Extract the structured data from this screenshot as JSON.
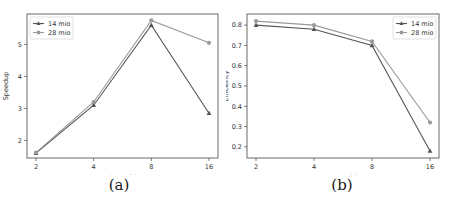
{
  "chart_data": [
    {
      "type": "line",
      "title": "",
      "caption": "(a)",
      "xlabel": "Number of GPUs",
      "ylabel": "Speedup",
      "x": [
        2,
        4,
        8,
        16
      ],
      "x_tick_labels": [
        "2",
        "4",
        "8",
        "16"
      ],
      "x_scale": "log2",
      "y_ticks": [
        2,
        3,
        4,
        5
      ],
      "ylim": [
        1.45,
        5.95
      ],
      "grid": false,
      "legend_position": "upper left",
      "series": [
        {
          "name": "14 mio",
          "marker": "triangle",
          "color": "#555555",
          "values": [
            1.6,
            3.1,
            5.6,
            2.85
          ]
        },
        {
          "name": "28 mio",
          "marker": "circle",
          "color": "#999999",
          "values": [
            1.62,
            3.2,
            5.75,
            5.05
          ]
        }
      ]
    },
    {
      "type": "line",
      "title": "",
      "caption": "(b)",
      "xlabel": "Number of GPUs",
      "ylabel": "Efficiency",
      "x": [
        2,
        4,
        8,
        16
      ],
      "x_tick_labels": [
        "2",
        "4",
        "8",
        "16"
      ],
      "x_scale": "log2",
      "y_ticks": [
        0.2,
        0.3,
        0.4,
        0.5,
        0.6,
        0.7,
        0.8
      ],
      "ylim": [
        0.145,
        0.855
      ],
      "grid": false,
      "legend_position": "upper right",
      "series": [
        {
          "name": "14 mio",
          "marker": "triangle",
          "color": "#555555",
          "values": [
            0.8,
            0.78,
            0.7,
            0.18
          ]
        },
        {
          "name": "28 mio",
          "marker": "circle",
          "color": "#999999",
          "values": [
            0.82,
            0.8,
            0.72,
            0.32
          ]
        }
      ]
    }
  ]
}
